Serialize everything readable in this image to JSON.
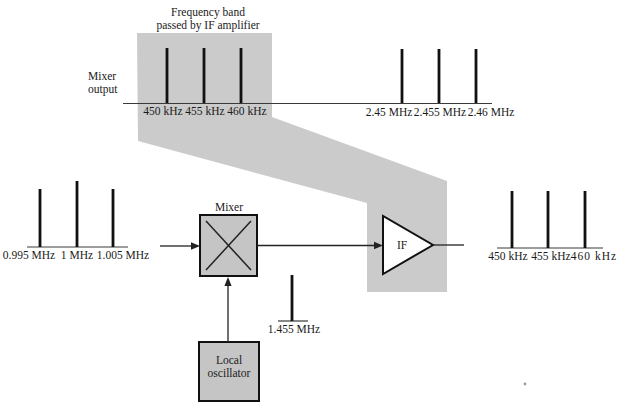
{
  "figure": {
    "annotation": {
      "line1": "Frequency band",
      "line2": "passed by IF amplifier"
    },
    "mixer_output": {
      "line1": "Mixer",
      "line2": "output"
    }
  },
  "spectra": {
    "if_band": {
      "labels": [
        "450 kHz",
        "455 kHz",
        "460 kHz"
      ]
    },
    "image_band": {
      "labels": [
        "2.45 MHz",
        "2.455 MHz",
        "2.46 MHz"
      ]
    },
    "input": {
      "labels": [
        "0.995 MHz",
        "1 MHz",
        "1.005 MHz"
      ]
    },
    "lo": {
      "label": "1.455 MHz"
    },
    "output": {
      "labels": [
        "450 kHz",
        "455 kHz",
        "460 kHz"
      ]
    }
  },
  "blocks": {
    "mixer": "Mixer",
    "if_amp": "IF",
    "lo": {
      "line1": "Local",
      "line2": "oscillator"
    }
  },
  "colors": {
    "band_highlight": "#cbcbcb",
    "box_fill": "#c5c5c5",
    "ink": "#1a1a1a",
    "if_amp_fill": "#ffffff"
  }
}
